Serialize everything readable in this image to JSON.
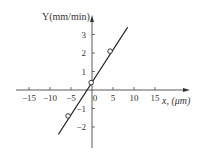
{
  "chart_data": {
    "type": "line",
    "title": "",
    "xlabel": "x, (μm)",
    "ylabel": "Y(mm/min)",
    "xlim": [
      -18,
      20
    ],
    "ylim": [
      -2.8,
      3.8
    ],
    "xticks": [
      -15,
      -10,
      -5,
      0,
      5,
      10,
      15
    ],
    "yticks": [
      -2,
      -1,
      1,
      2,
      3
    ],
    "xtick_labels": [
      "−15",
      "−10",
      "−5",
      "0",
      "5",
      "10",
      "15"
    ],
    "ytick_labels": [
      "−2",
      "−1",
      "1",
      "2",
      "3"
    ],
    "grid": false,
    "legend": [],
    "series": [
      {
        "name": "fit line",
        "x": [
          -8,
          8.5
        ],
        "y": [
          -2.4,
          3.4
        ]
      },
      {
        "name": "data points",
        "marker": "open-circle",
        "x": [
          -5.7,
          -0.2,
          4.3
        ],
        "y": [
          -1.4,
          0.4,
          2.1
        ]
      }
    ]
  }
}
